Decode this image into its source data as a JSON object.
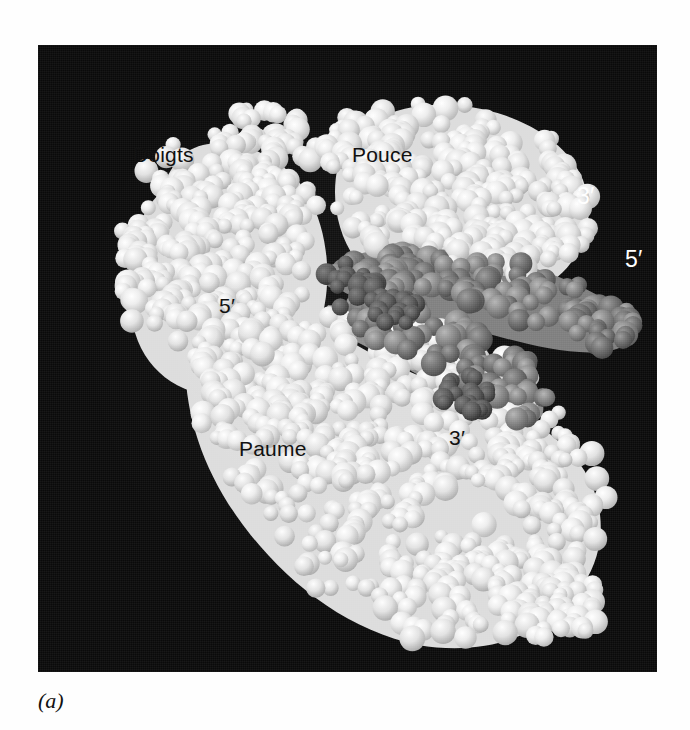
{
  "figure": {
    "caption": "(a)",
    "kind": "space-filling molecular model photograph",
    "background_color": "#0a0a0a",
    "protein_color": "#e8e8e8",
    "dna_color": "#8a8a8a"
  },
  "labels": {
    "fingers": {
      "text": "Doigts",
      "color": "#111111",
      "x": 133,
      "y": 144
    },
    "thumb": {
      "text": "Pouce",
      "color": "#111111",
      "x": 352,
      "y": 144
    },
    "palm": {
      "text": "Paume",
      "color": "#111111",
      "x": 239,
      "y": 438
    },
    "five_prime_left": {
      "text": "5′",
      "color": "#111111",
      "x": 219,
      "y": 295
    },
    "three_prime_bottom": {
      "text": "3′",
      "color": "#111111",
      "x": 449,
      "y": 427
    },
    "three_prime_right": {
      "text": "3′",
      "color": "#ffffff",
      "x": 577,
      "y": 185
    },
    "five_prime_right": {
      "text": "5′",
      "color": "#ffffff",
      "x": 625,
      "y": 248
    }
  },
  "plate": {
    "left": 38,
    "top": 45,
    "width": 619,
    "height": 627
  }
}
